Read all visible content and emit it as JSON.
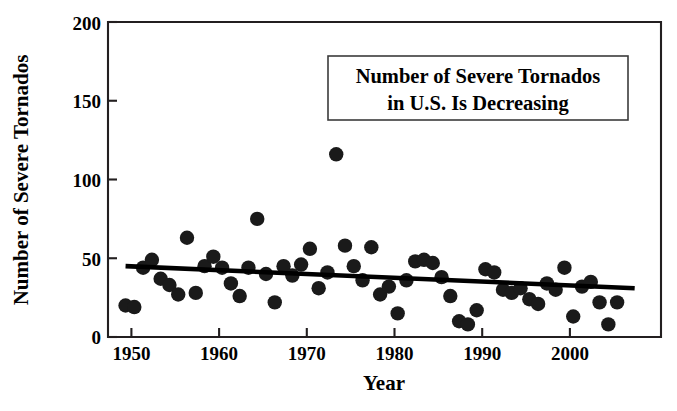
{
  "chart_data": {
    "type": "scatter",
    "title": "",
    "annotation_box": {
      "line1": "Number of Severe Tornados",
      "line2": "in U.S. Is Decreasing"
    },
    "xlabel": "Year",
    "ylabel": "Number of Severe Tornados",
    "xlim": [
      1948,
      2011
    ],
    "ylim": [
      0,
      200
    ],
    "xticks": [
      1950,
      1960,
      1970,
      1980,
      1990,
      2000
    ],
    "yticks": [
      0,
      50,
      100,
      150,
      200
    ],
    "grid": false,
    "legend": null,
    "marker_color": "#1a1a1a",
    "trendline_color": "#000000",
    "x": [
      1950,
      1951,
      1952,
      1953,
      1954,
      1955,
      1956,
      1957,
      1958,
      1959,
      1960,
      1961,
      1962,
      1963,
      1964,
      1965,
      1966,
      1967,
      1968,
      1969,
      1970,
      1971,
      1972,
      1973,
      1974,
      1975,
      1976,
      1977,
      1978,
      1979,
      1980,
      1981,
      1982,
      1983,
      1984,
      1985,
      1986,
      1987,
      1988,
      1989,
      1990,
      1991,
      1992,
      1993,
      1994,
      1995,
      1996,
      1997,
      1998,
      1999,
      2000,
      2001,
      2002,
      2003,
      2004,
      2005,
      2006
    ],
    "values": [
      20,
      19,
      44,
      49,
      37,
      33,
      27,
      63,
      28,
      45,
      51,
      44,
      34,
      26,
      44,
      75,
      40,
      22,
      45,
      39,
      46,
      56,
      31,
      41,
      116,
      58,
      45,
      36,
      57,
      27,
      32,
      15,
      36,
      48,
      49,
      47,
      38,
      26,
      10,
      8,
      17,
      43,
      41,
      30,
      28,
      31,
      24,
      21,
      34,
      30,
      44,
      13,
      32,
      35,
      22,
      8,
      22
    ],
    "trendline": {
      "x_start": 1950,
      "y_start": 45,
      "x_end": 2008,
      "y_end": 31,
      "description": "linear decreasing fit"
    }
  }
}
